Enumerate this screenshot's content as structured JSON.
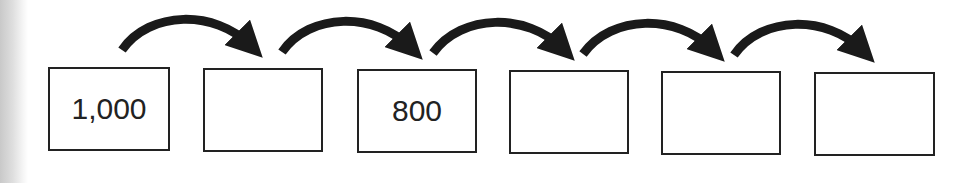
{
  "diagram": {
    "type": "number-sequence",
    "boxes": [
      {
        "value": "1,000"
      },
      {
        "value": ""
      },
      {
        "value": "800"
      },
      {
        "value": ""
      },
      {
        "value": ""
      },
      {
        "value": ""
      }
    ],
    "arrow_count": 5,
    "colors": {
      "border": "#222222",
      "arrow": "#1a1a1a",
      "text": "#222222"
    }
  }
}
